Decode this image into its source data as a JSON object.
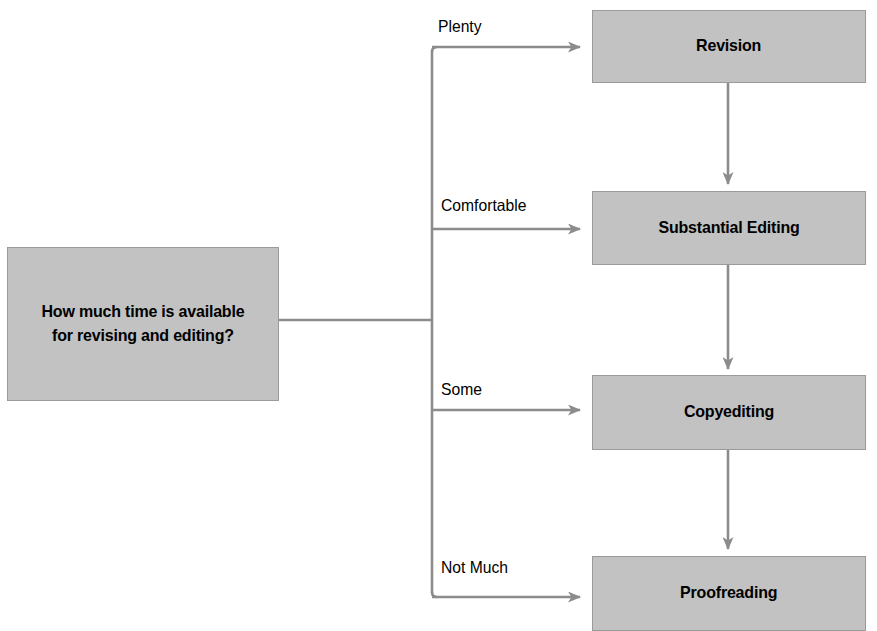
{
  "diagram": {
    "title": "How much time is available for revising and editing?",
    "type": "decision-flowchart",
    "colors": {
      "node_fill": "#c2c2c2",
      "node_border": "#9a9a9a",
      "connector": "#8c8c8c",
      "text": "#000000",
      "background": "#ffffff"
    },
    "decision": {
      "id": "time-available",
      "label": "How much time is available\nfor revising and editing?"
    },
    "branches": [
      {
        "id": "plenty",
        "label": "Plenty",
        "target": "revision"
      },
      {
        "id": "comfortable",
        "label": "Comfortable",
        "target": "substantial-editing"
      },
      {
        "id": "some",
        "label": "Some",
        "target": "copyediting"
      },
      {
        "id": "not-much",
        "label": "Not Much",
        "target": "proofreading"
      }
    ],
    "stages": [
      {
        "id": "revision",
        "label": "Revision"
      },
      {
        "id": "substantial-editing",
        "label": "Substantial Editing"
      },
      {
        "id": "copyediting",
        "label": "Copyediting"
      },
      {
        "id": "proofreading",
        "label": "Proofreading"
      }
    ],
    "flow_sequence": [
      "Revision",
      "Substantial Editing",
      "Copyediting",
      "Proofreading"
    ]
  }
}
